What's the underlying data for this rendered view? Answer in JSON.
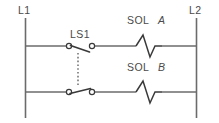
{
  "diagram": {
    "type": "ladder-logic-schematic",
    "rails": {
      "left_label": "L1",
      "right_label": "L2"
    },
    "switch": {
      "label": "LS1",
      "kind": "limit-switch-double-pole-mechanically-linked",
      "upper_state": "normally-open",
      "lower_state": "normally-closed",
      "link_style": "dashed"
    },
    "rungs": [
      {
        "name": "rung-1",
        "load_prefix": "SOL",
        "load_letter": "A",
        "load_symbol": "solenoid-coil-zigzag",
        "contact": "LS1-normally-open"
      },
      {
        "name": "rung-2",
        "load_prefix": "SOL",
        "load_letter": "B",
        "load_symbol": "solenoid-coil-zigzag",
        "contact": "LS1-normally-closed"
      }
    ],
    "colors": {
      "wire": "#6b6b6b",
      "symbol": "#3a3a3a",
      "text": "#4a4a4a",
      "background": "#ffffff"
    }
  }
}
